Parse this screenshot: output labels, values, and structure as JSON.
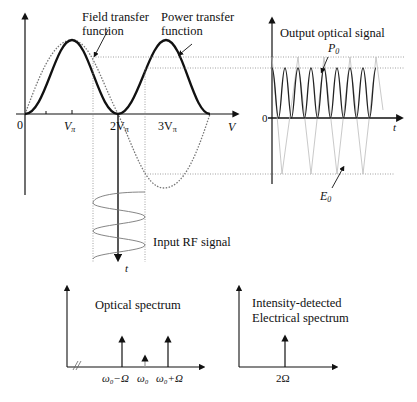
{
  "labels": {
    "field_tf": [
      "Field transfer",
      "function"
    ],
    "power_tf": [
      "Power transfer",
      "function"
    ],
    "axis_zero": "0",
    "v_pi": "V",
    "two_v_pi": "2V",
    "three_v_pi": "3V",
    "pi_sub": "π",
    "v_axis": "V",
    "output_title": "Output optical signal",
    "p0": "P",
    "e0": "E",
    "sub0": "0",
    "out_zero": "0",
    "t_axis": "t",
    "input_rf": "Input RF signal",
    "rf_t": "t",
    "optical_spectrum": "Optical spectrum",
    "w_minus": "ω₀−Ω",
    "w0": "ω₀",
    "w_plus": "ω₀+Ω",
    "electrical_title": [
      "Intensity-detected",
      "Electrical spectrum"
    ],
    "two_omega": "2Ω"
  },
  "colors": {
    "ink": "#111111",
    "dotted": "#777777",
    "faint": "#bbbbbb",
    "carrier": "#999999"
  }
}
